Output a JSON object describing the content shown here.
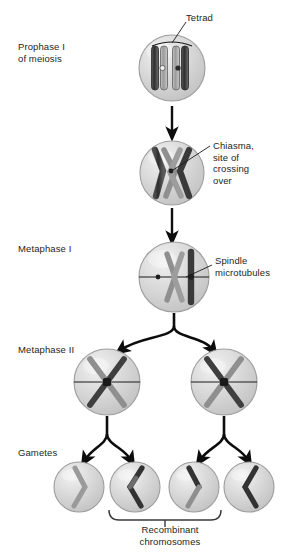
{
  "diagram": {
    "stage_labels": [
      {
        "id": "prophase-i",
        "text": "Prophase I\nof meiosis",
        "x": 18,
        "y": 41
      },
      {
        "id": "metaphase-i",
        "text": "Metaphase I",
        "x": 18,
        "y": 243
      },
      {
        "id": "metaphase-ii",
        "text": "Metaphase II",
        "x": 18,
        "y": 344
      },
      {
        "id": "gametes",
        "text": "Gametes",
        "x": 18,
        "y": 447
      }
    ],
    "callouts": [
      {
        "id": "tetrad",
        "text": "Tetrad",
        "x": 186,
        "y": 12
      },
      {
        "id": "chiasma",
        "text": "Chiasma,\nsite of\ncrossing\nover",
        "x": 213,
        "y": 140
      },
      {
        "id": "spindle-microtubules",
        "text": "Spindle\nmicrotubules",
        "x": 215,
        "y": 255
      }
    ],
    "bracket_label": {
      "id": "recombinant-chromosomes",
      "text": "Recombinant\nchromosomes",
      "x": 110,
      "y": 524,
      "width": 120
    },
    "colors": {
      "cell_fill": "#d2d2d2",
      "cell_stroke": "#9a9a9a",
      "cell_highlight": "#efefef",
      "chromosome_dark": "#3a3a3a",
      "chromosome_light": "#9e9e9e",
      "chromosome_outline": "#2b2b2b",
      "arrow": "#0d0d0d",
      "leader_line": "#1a1a1a",
      "text": "#231f20"
    },
    "cells": [
      {
        "id": "cell-prophase-i",
        "cx": 172,
        "cy": 68,
        "r": 33,
        "stage": "Prophase I",
        "chromatids": 4
      },
      {
        "id": "cell-chiasma",
        "cx": 172,
        "cy": 173,
        "r": 32,
        "stage": "Crossing over",
        "chromatids": 4
      },
      {
        "id": "cell-metaphase-i",
        "cx": 174,
        "cy": 277,
        "r": 35,
        "stage": "Metaphase I",
        "chromatids": 4
      },
      {
        "id": "cell-metaphase-ii-left",
        "cx": 107,
        "cy": 382,
        "r": 33,
        "stage": "Metaphase II",
        "chromatids": 2
      },
      {
        "id": "cell-metaphase-ii-right",
        "cx": 224,
        "cy": 382,
        "r": 33,
        "stage": "Metaphase II",
        "chromatids": 2
      },
      {
        "id": "gamete-1",
        "cx": 79,
        "cy": 487,
        "r": 25,
        "stage": "Gamete",
        "recombinant": false
      },
      {
        "id": "gamete-2",
        "cx": 135,
        "cy": 487,
        "r": 25,
        "stage": "Gamete",
        "recombinant": true
      },
      {
        "id": "gamete-3",
        "cx": 194,
        "cy": 487,
        "r": 25,
        "stage": "Gamete",
        "recombinant": true
      },
      {
        "id": "gamete-4",
        "cx": 249,
        "cy": 487,
        "r": 25,
        "stage": "Gamete",
        "recombinant": false
      }
    ]
  }
}
